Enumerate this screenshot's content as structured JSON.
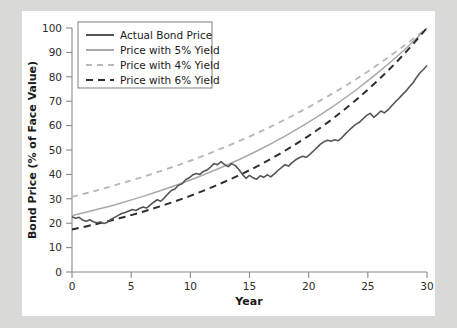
{
  "figure": {
    "background_color": "#ffffff",
    "page_background_color": "#d9d9d7"
  },
  "chart_data": {
    "type": "line",
    "title": "",
    "xlabel": "Year",
    "ylabel": "Bond Price (% of Face Value)",
    "xlim": [
      0,
      30
    ],
    "ylim": [
      0,
      100
    ],
    "xticks": [
      0,
      5,
      10,
      15,
      20,
      25,
      30
    ],
    "yticks": [
      0,
      10,
      20,
      30,
      40,
      50,
      60,
      70,
      80,
      90,
      100
    ],
    "grid": false,
    "legend_position": "upper left",
    "series": [
      {
        "name": "Actual Bond Price",
        "color": "#555555",
        "style": "solid",
        "width": 1.6,
        "x": [
          0,
          0.3,
          0.6,
          0.9,
          1.2,
          1.5,
          1.8,
          2.1,
          2.4,
          2.7,
          3.0,
          3.3,
          3.6,
          3.9,
          4.2,
          4.5,
          4.8,
          5.1,
          5.4,
          5.7,
          6.0,
          6.3,
          6.6,
          6.9,
          7.2,
          7.5,
          7.8,
          8.1,
          8.4,
          8.7,
          9.0,
          9.3,
          9.6,
          9.9,
          10.2,
          10.5,
          10.8,
          11.1,
          11.4,
          11.7,
          12.0,
          12.3,
          12.6,
          12.9,
          13.2,
          13.5,
          13.8,
          14.1,
          14.4,
          14.7,
          15.0,
          15.3,
          15.6,
          15.9,
          16.2,
          16.5,
          16.8,
          17.1,
          17.4,
          17.7,
          18.0,
          18.3,
          18.6,
          18.9,
          19.2,
          19.5,
          19.8,
          20.1,
          20.4,
          20.7,
          21.0,
          21.3,
          21.6,
          21.9,
          22.2,
          22.5,
          22.8,
          23.1,
          23.4,
          23.7,
          24.0,
          24.3,
          24.6,
          24.9,
          25.2,
          25.5,
          25.8,
          26.1,
          26.4,
          26.7,
          27.0,
          27.3,
          27.6,
          27.9,
          28.2,
          28.5,
          28.8,
          29.1,
          29.4,
          29.7,
          30.0
        ],
        "y": [
          22.6,
          22.0,
          22.4,
          21.3,
          20.8,
          21.4,
          20.6,
          20.2,
          20.5,
          19.9,
          20.4,
          21.6,
          22.4,
          23.2,
          24.0,
          24.4,
          25.0,
          25.6,
          25.2,
          26.0,
          26.6,
          26.2,
          27.4,
          28.6,
          29.6,
          29.0,
          30.4,
          32.0,
          33.4,
          34.0,
          35.6,
          36.2,
          37.8,
          38.6,
          39.8,
          40.4,
          40.0,
          41.2,
          41.8,
          43.0,
          44.4,
          44.0,
          45.2,
          44.0,
          43.2,
          44.4,
          43.6,
          42.0,
          40.0,
          38.4,
          39.6,
          38.6,
          38.0,
          39.4,
          38.8,
          39.8,
          39.0,
          40.2,
          41.6,
          42.8,
          44.0,
          43.4,
          44.8,
          46.0,
          46.8,
          47.4,
          47.0,
          48.2,
          49.6,
          51.0,
          52.4,
          53.4,
          54.0,
          53.6,
          54.2,
          53.8,
          55.0,
          56.6,
          58.0,
          59.4,
          60.6,
          61.4,
          62.8,
          64.2,
          65.0,
          63.4,
          64.6,
          66.0,
          65.2,
          66.4,
          68.0,
          69.6,
          71.0,
          72.6,
          74.0,
          75.8,
          77.4,
          79.6,
          81.6,
          83.0,
          84.6
        ]
      },
      {
        "name": "Price with 5% Yield",
        "color": "#a8a8a8",
        "style": "solid",
        "width": 1.5,
        "x": [
          0,
          2,
          4,
          6,
          8,
          10,
          12,
          14,
          16,
          18,
          20,
          22,
          24,
          26,
          28,
          30
        ],
        "y": [
          23.1,
          25.5,
          28.1,
          31.0,
          34.2,
          37.7,
          41.6,
          45.8,
          50.5,
          55.7,
          61.4,
          67.7,
          74.6,
          82.3,
          90.7,
          100.0
        ]
      },
      {
        "name": "Price with 4% Yield",
        "color": "#b8b8b8",
        "style": "dashed",
        "width": 1.9,
        "x": [
          0,
          2,
          4,
          6,
          8,
          10,
          12,
          14,
          16,
          18,
          20,
          22,
          24,
          26,
          28,
          30
        ],
        "y": [
          30.8,
          33.3,
          36.1,
          39.0,
          42.2,
          45.6,
          49.4,
          53.4,
          57.7,
          62.5,
          67.6,
          73.1,
          79.0,
          85.5,
          92.5,
          100.0
        ]
      },
      {
        "name": "Price with 6% Yield",
        "color": "#2e2e2e",
        "style": "dashed",
        "width": 2.0,
        "x": [
          0,
          2,
          4,
          6,
          8,
          10,
          12,
          14,
          16,
          18,
          20,
          22,
          24,
          26,
          28,
          30
        ],
        "y": [
          17.4,
          19.6,
          22.0,
          24.7,
          27.8,
          31.2,
          35.1,
          39.4,
          44.2,
          49.7,
          55.8,
          62.7,
          70.5,
          79.2,
          89.0,
          100.0
        ]
      }
    ]
  },
  "legend": {
    "items": [
      {
        "label": "Actual Bond Price"
      },
      {
        "label": "Price with 5% Yield"
      },
      {
        "label": "Price with 4% Yield"
      },
      {
        "label": "Price with 6% Yield"
      }
    ]
  }
}
